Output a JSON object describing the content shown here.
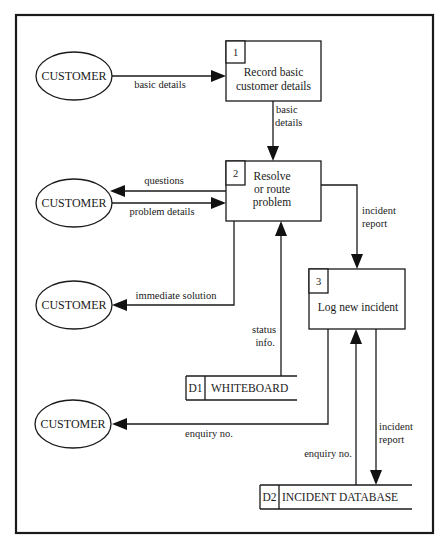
{
  "diagram": {
    "type": "data flow diagram",
    "entities": [
      {
        "id": "c1",
        "label": "CUSTOMER"
      },
      {
        "id": "c2",
        "label": "CUSTOMER"
      },
      {
        "id": "c3",
        "label": "CUSTOMER"
      },
      {
        "id": "c4",
        "label": "CUSTOMER"
      }
    ],
    "processes": [
      {
        "id": "p1",
        "number": "1",
        "lines": [
          "Record basic",
          "customer details"
        ]
      },
      {
        "id": "p2",
        "number": "2",
        "lines": [
          "Resolve",
          "or route",
          "problem"
        ]
      },
      {
        "id": "p3",
        "number": "3",
        "lines": [
          "Log new incident"
        ]
      }
    ],
    "stores": [
      {
        "id": "d1",
        "code": "D1",
        "label": "WHITEBOARD"
      },
      {
        "id": "d2",
        "code": "D2",
        "label": "INCIDENT DATABASE"
      }
    ],
    "flows": [
      {
        "from": "c1",
        "to": "p1",
        "lines": [
          "basic details"
        ]
      },
      {
        "from": "p1",
        "to": "p2",
        "lines": [
          "basic",
          "details"
        ]
      },
      {
        "from": "p2",
        "to": "c2",
        "lines": [
          "questions"
        ]
      },
      {
        "from": "c2",
        "to": "p2",
        "lines": [
          "problem details"
        ]
      },
      {
        "from": "p2",
        "to": "c3",
        "lines": [
          "immediate solution"
        ]
      },
      {
        "from": "p2",
        "to": "p3",
        "lines": [
          "incident",
          "report"
        ]
      },
      {
        "from": "d1",
        "to": "p2",
        "lines": [
          "status",
          "info."
        ]
      },
      {
        "from": "p3",
        "to": "c4",
        "lines": [
          "enquiry no."
        ]
      },
      {
        "from": "d2",
        "to": "p3",
        "lines": [
          "enquiry no."
        ]
      },
      {
        "from": "p3",
        "to": "d2",
        "lines": [
          "incident",
          "report"
        ]
      }
    ]
  }
}
